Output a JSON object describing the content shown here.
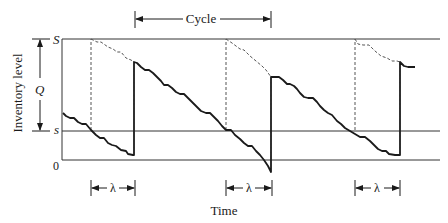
{
  "diagram": {
    "y_axis_label": "Inventory level",
    "x_axis_label": "Time",
    "levels": {
      "S": "S",
      "s": "s",
      "zero": "0"
    },
    "order_quantity_label": "Q",
    "cycle_label": "Cycle",
    "lead_time_label": "λ",
    "lead_time_count": 3,
    "colors": {
      "line": "#1a1a1a",
      "dashed": "#555555",
      "axis": "#333333",
      "background": "#ffffff"
    }
  }
}
